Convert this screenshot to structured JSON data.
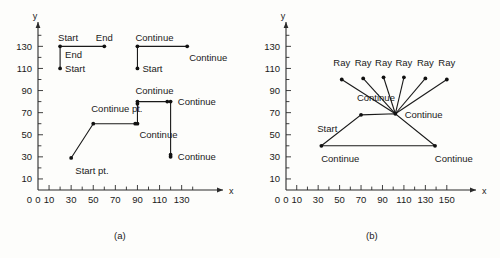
{
  "figure": {
    "captions": [
      {
        "id": "a",
        "text": "(a)"
      },
      {
        "id": "b",
        "text": "(b)"
      }
    ]
  },
  "chart_data": [
    {
      "type": "line",
      "panel": "(a)",
      "title": "",
      "xlabel": "x",
      "ylabel": "y",
      "xlim": [
        0,
        145
      ],
      "ylim": [
        0,
        140
      ],
      "xticks_major": [
        0,
        10,
        30,
        50,
        70,
        90,
        110,
        130
      ],
      "xticks_minor": [
        20,
        40,
        60,
        80,
        100,
        120,
        140
      ],
      "yticks_major": [
        10,
        30,
        50,
        70,
        90,
        110,
        130
      ],
      "yticks_minor": [
        20,
        40,
        60,
        80,
        100,
        120,
        140
      ],
      "grid": false,
      "legend": "none",
      "series": [
        {
          "name": "stroke-1",
          "points": [
            [
              20,
              110
            ],
            [
              20,
              130
            ],
            [
              60,
              130
            ]
          ],
          "markers": [
            [
              20,
              110
            ],
            [
              20,
              130
            ],
            [
              60,
              130
            ]
          ]
        },
        {
          "name": "stroke-2",
          "points": [
            [
              90,
              110
            ],
            [
              90,
              130
            ],
            [
              135,
              130
            ]
          ],
          "markers": [
            [
              90,
              110
            ],
            [
              90,
              130
            ],
            [
              135,
              130
            ]
          ]
        },
        {
          "name": "stroke-3",
          "points": [
            [
              30,
              29
            ],
            [
              50,
              60
            ],
            [
              90,
              60
            ],
            [
              90,
              80
            ],
            [
              120,
              80
            ],
            [
              120,
              30
            ]
          ],
          "markers": [
            [
              30,
              29
            ],
            [
              50,
              60
            ],
            [
              88,
              60
            ],
            [
              90,
              60
            ],
            [
              90,
              78
            ],
            [
              90,
              80
            ],
            [
              117,
              80
            ],
            [
              120,
              80
            ],
            [
              120,
              32
            ],
            [
              120,
              30
            ]
          ]
        }
      ],
      "annotations": [
        {
          "text": "Start",
          "x": 20,
          "y": 130,
          "place": "above-left"
        },
        {
          "text": "End",
          "x": 60,
          "y": 130,
          "place": "above"
        },
        {
          "text": "End",
          "x": 20,
          "y": 122,
          "place": "right"
        },
        {
          "text": "Start",
          "x": 20,
          "y": 110,
          "place": "right"
        },
        {
          "text": "Continue",
          "x": 90,
          "y": 130,
          "place": "above-left"
        },
        {
          "text": "Continue",
          "x": 135,
          "y": 124,
          "place": "below-left"
        },
        {
          "text": "Start",
          "x": 90,
          "y": 110,
          "place": "right"
        },
        {
          "text": "Continue",
          "x": 90,
          "y": 82,
          "place": "above-left"
        },
        {
          "text": "Continue",
          "x": 122,
          "y": 80,
          "place": "right"
        },
        {
          "text": "Continue pt.",
          "x": 50,
          "y": 66,
          "place": "above-left"
        },
        {
          "text": "Continue",
          "x": 90,
          "y": 54,
          "place": "below-left"
        },
        {
          "text": "Continue",
          "x": 122,
          "y": 30,
          "place": "right"
        },
        {
          "text": "Start pt.",
          "x": 32,
          "y": 22,
          "place": "below-right"
        }
      ]
    },
    {
      "type": "line",
      "panel": "(b)",
      "title": "",
      "xlabel": "x",
      "ylabel": "y",
      "xlim": [
        0,
        160
      ],
      "ylim": [
        0,
        140
      ],
      "xticks_major": [
        0,
        10,
        30,
        50,
        70,
        90,
        110,
        130,
        150
      ],
      "xticks_minor": [
        20,
        40,
        60,
        80,
        100,
        120,
        140
      ],
      "yticks_major": [
        10,
        30,
        50,
        70,
        90,
        110,
        130
      ],
      "yticks_minor": [
        20,
        40,
        60,
        80,
        100,
        120,
        140
      ],
      "grid": false,
      "legend": "none",
      "hub": [
        102,
        69
      ],
      "series": [
        {
          "name": "outline",
          "points": [
            [
              33,
              40
            ],
            [
              70,
              68
            ],
            [
              102,
              69
            ],
            [
              139,
              40
            ],
            [
              33,
              40
            ]
          ],
          "markers": [
            [
              33,
              40
            ],
            [
              70,
              68
            ],
            [
              102,
              69
            ],
            [
              139,
              40
            ]
          ]
        },
        {
          "name": "ray-1",
          "points": [
            [
              102,
              69
            ],
            [
              52,
              100
            ]
          ],
          "markers": [
            [
              52,
              100
            ]
          ]
        },
        {
          "name": "ray-2",
          "points": [
            [
              102,
              69
            ],
            [
              72,
              101
            ]
          ],
          "markers": [
            [
              72,
              101
            ]
          ]
        },
        {
          "name": "ray-3",
          "points": [
            [
              102,
              69
            ],
            [
              91,
              102
            ]
          ],
          "markers": [
            [
              91,
              102
            ]
          ]
        },
        {
          "name": "ray-4",
          "points": [
            [
              102,
              69
            ],
            [
              110,
              102
            ]
          ],
          "markers": [
            [
              110,
              102
            ]
          ]
        },
        {
          "name": "ray-5",
          "points": [
            [
              102,
              69
            ],
            [
              130,
              101
            ]
          ],
          "markers": [
            [
              130,
              101
            ]
          ]
        },
        {
          "name": "ray-6",
          "points": [
            [
              102,
              69
            ],
            [
              150,
              100
            ]
          ],
          "markers": [
            [
              150,
              100
            ]
          ]
        }
      ],
      "annotations": [
        {
          "text": "Ray",
          "x": 52,
          "y": 108,
          "place": "above"
        },
        {
          "text": "Ray",
          "x": 72,
          "y": 108,
          "place": "above"
        },
        {
          "text": "Ray",
          "x": 91,
          "y": 108,
          "place": "above"
        },
        {
          "text": "Ray",
          "x": 110,
          "y": 108,
          "place": "above"
        },
        {
          "text": "Ray",
          "x": 130,
          "y": 108,
          "place": "above"
        },
        {
          "text": "Ray",
          "x": 150,
          "y": 108,
          "place": "above"
        },
        {
          "text": "Continue",
          "x": 68,
          "y": 76,
          "place": "above-left"
        },
        {
          "text": "Continue",
          "x": 106,
          "y": 68,
          "place": "right"
        },
        {
          "text": "Start",
          "x": 31,
          "y": 48,
          "place": "above-left"
        },
        {
          "text": "Continue",
          "x": 31,
          "y": 33,
          "place": "below-right"
        },
        {
          "text": "Continue",
          "x": 137,
          "y": 33,
          "place": "below-left"
        }
      ]
    }
  ]
}
